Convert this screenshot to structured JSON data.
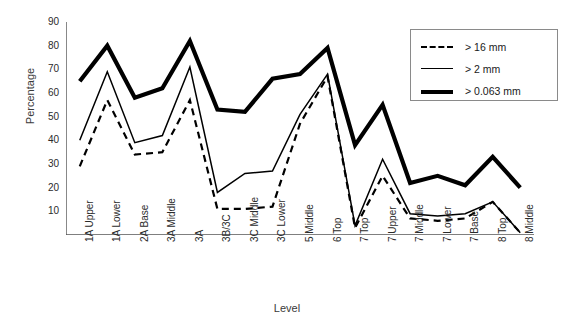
{
  "chart_data": {
    "type": "line",
    "title": "",
    "xlabel": "Level",
    "ylabel": "Percentage",
    "ylim": [
      0,
      90
    ],
    "yticks": [
      10,
      20,
      30,
      40,
      50,
      60,
      70,
      80,
      90
    ],
    "grid": false,
    "legend_position": "top-right",
    "categories": [
      "1A Upper",
      "1A Lower",
      "2A Base",
      "3A Middle",
      "3A",
      "3B/3C",
      "3C Middle",
      "3C Lower",
      "5 Middle",
      "6 Top",
      "7 Top",
      "7 Upper",
      "7 Middle",
      "7 Lower",
      "7 Base",
      "8 Top",
      "8 Middle"
    ],
    "series": [
      {
        "name": "> 16 mm",
        "style": "dashed",
        "values": [
          29,
          57,
          34,
          35,
          57,
          11,
          11,
          12,
          47,
          67,
          3,
          25,
          7,
          6,
          7,
          14,
          1
        ]
      },
      {
        "name": "> 2 mm",
        "style": "thin-solid",
        "values": [
          40,
          69,
          39,
          42,
          71,
          18,
          26,
          27,
          51,
          68,
          4,
          32,
          9,
          8,
          9,
          14,
          1
        ]
      },
      {
        "name": "> 0.063 mm",
        "style": "thick-solid",
        "values": [
          65,
          80,
          58,
          62,
          82,
          53,
          52,
          66,
          68,
          79,
          38,
          55,
          22,
          25,
          21,
          33,
          20
        ]
      }
    ]
  },
  "legend": {
    "items": [
      {
        "label": "> 16 mm",
        "style": "dashed"
      },
      {
        "label": "> 2 mm",
        "style": "thin-solid"
      },
      {
        "label": "> 0.063 mm",
        "style": "thick-solid"
      }
    ]
  },
  "colors": {
    "line": "#000000",
    "axis": "#555555",
    "text": "#2b2b2b"
  }
}
